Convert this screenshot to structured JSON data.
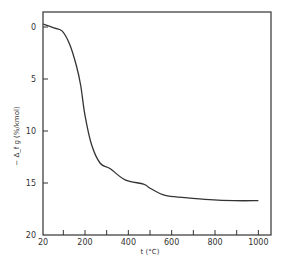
{
  "chart_data": {
    "type": "line",
    "title": "",
    "xlabel": "t (°C)",
    "ylabel": "−Δ_f g (%/kmol)",
    "xlim": [
      20,
      1050
    ],
    "ylim": [
      0,
      20
    ],
    "y_inverted": true,
    "grid": false,
    "legend": null,
    "x_ticks": [
      20,
      200,
      400,
      600,
      800,
      1000
    ],
    "x_minor_ticks": [
      100,
      200,
      300,
      400,
      500,
      600,
      700,
      800,
      900,
      1000
    ],
    "y_ticks": [
      0,
      5,
      10,
      15,
      20
    ],
    "series": [
      {
        "name": "mass loss",
        "x": [
          20,
          60,
          95,
          130,
          160,
          180,
          200,
          230,
          270,
          315,
          385,
          470,
          500,
          570,
          660,
          775,
          890,
          1000
        ],
        "y": [
          0,
          0.1,
          0.4,
          1.7,
          3.7,
          5.6,
          8.5,
          11.3,
          13.1,
          13.6,
          14.7,
          15.1,
          15.5,
          16.2,
          16.4,
          16.6,
          16.7,
          16.7
        ]
      }
    ]
  },
  "labels": {
    "x_axis": "t (°C)",
    "y_axis": "− Δ_f g (%/kmol)"
  }
}
